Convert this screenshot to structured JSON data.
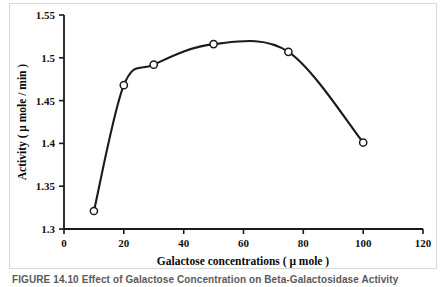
{
  "figure": {
    "caption": "FIGURE 14.10   Effect of Galactose Concentration on Beta-Galactosidase Activity"
  },
  "chart_data": {
    "type": "line",
    "title": "",
    "subtitle": "",
    "xlabel": "Galactose concentrations ( μ mole )",
    "ylabel": "Activity ( μ mole / min )",
    "xlim": [
      0,
      120
    ],
    "ylim": [
      1.3,
      1.55
    ],
    "xticks": [
      0,
      20,
      40,
      60,
      80,
      100,
      120
    ],
    "yticks": [
      1.3,
      1.35,
      1.4,
      1.45,
      1.5,
      1.55
    ],
    "xtick_labels": [
      "0",
      "20",
      "40",
      "60",
      "80",
      "100",
      "120"
    ],
    "ytick_labels": [
      "1.3",
      "1.35",
      "1.4",
      "1.45",
      "1.5",
      "1.55"
    ],
    "grid": false,
    "legend": false,
    "legend_position": "none",
    "marker": "open-circle",
    "line_color": "#1a1a1a",
    "marker_color": "#1a1a1a",
    "x": [
      10,
      20,
      30,
      50,
      75,
      100
    ],
    "values": [
      1.321,
      1.468,
      1.492,
      1.516,
      1.507,
      1.401
    ],
    "series": [
      {
        "name": "Activity",
        "x": [
          10,
          20,
          30,
          50,
          75,
          100
        ],
        "values": [
          1.321,
          1.468,
          1.492,
          1.516,
          1.507,
          1.401
        ]
      }
    ]
  }
}
